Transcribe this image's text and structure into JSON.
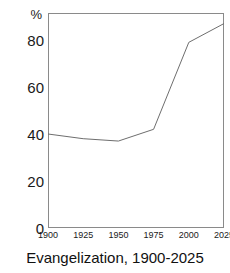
{
  "caption": "Evangelization, 1900-2025",
  "axis": {
    "y_unit_label": "%",
    "y_ticks": [
      "0",
      "20",
      "40",
      "60",
      "80"
    ],
    "x_ticks": [
      "1900",
      "1925",
      "1950",
      "1975",
      "2000",
      "2025"
    ]
  },
  "style": {
    "line_color": "#6e6e6e",
    "frame_color": "#8a8a8a",
    "text_color": "#1a1a1a",
    "background": "#ffffff"
  },
  "chart_data": {
    "type": "line",
    "title": "Evangelization, 1900-2025",
    "xlabel": "",
    "ylabel": "%",
    "x": [
      1900,
      1925,
      1950,
      1975,
      2000,
      2025
    ],
    "series": [
      {
        "name": "Evangelization",
        "values": [
          40,
          38,
          37,
          42,
          79,
          87
        ]
      }
    ],
    "xlim": [
      1900,
      2025
    ],
    "ylim": [
      0,
      95
    ],
    "x_tick_values": [
      1900,
      1925,
      1950,
      1975,
      2000,
      2025
    ],
    "y_tick_values": [
      0,
      20,
      40,
      60,
      80
    ],
    "grid": false,
    "markers": false,
    "legend": null
  }
}
